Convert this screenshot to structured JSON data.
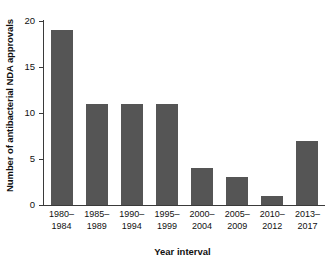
{
  "chart_data": {
    "type": "bar",
    "title": "",
    "xlabel": "Year interval",
    "ylabel": "Number of antibacterial NDA approvals",
    "categories": [
      "1980–1984",
      "1985–1989",
      "1990–1994",
      "1995–1999",
      "2000–2004",
      "2005–2009",
      "2010–2012",
      "2013–2017"
    ],
    "category_lines": [
      [
        "1980–",
        "1984"
      ],
      [
        "1985–",
        "1989"
      ],
      [
        "1990–",
        "1994"
      ],
      [
        "1995–",
        "1999"
      ],
      [
        "2000–",
        "2004"
      ],
      [
        "2005–",
        "2009"
      ],
      [
        "2010–",
        "2012"
      ],
      [
        "2013–",
        "2017"
      ]
    ],
    "values": [
      19,
      11,
      11,
      11,
      4,
      3,
      1,
      7
    ],
    "ylim": [
      0,
      20
    ],
    "yticks": [
      0,
      5,
      10,
      15,
      20
    ],
    "ytick_labels": [
      "0",
      "5",
      "10",
      "15",
      "20"
    ],
    "grid": false,
    "legend": null,
    "bar_color": "#555555",
    "axis_color": "#3a3a3a",
    "background": "#ffffff"
  }
}
